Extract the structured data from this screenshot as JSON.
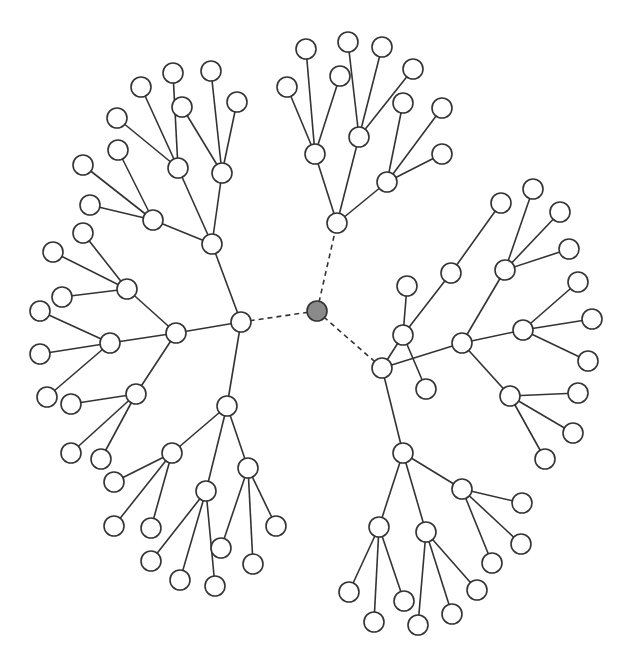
{
  "diagram": {
    "type": "radial-tree",
    "node_radius": 10,
    "colors": {
      "edge": "#333333",
      "node_fill": "#ffffff",
      "root_fill": "#8a8a8a"
    },
    "nodes": [
      {
        "id": "root",
        "x": 317,
        "y": 311,
        "root": true
      },
      {
        "id": "L",
        "x": 241,
        "y": 322
      },
      {
        "id": "LA",
        "x": 212,
        "y": 244
      },
      {
        "id": "LA1",
        "x": 153,
        "y": 220
      },
      {
        "id": "LA1a",
        "x": 83,
        "y": 165
      },
      {
        "id": "LA1b",
        "x": 90,
        "y": 205
      },
      {
        "id": "LA1c",
        "x": 118,
        "y": 150
      },
      {
        "id": "LA2",
        "x": 178,
        "y": 168
      },
      {
        "id": "LA2a",
        "x": 117,
        "y": 118
      },
      {
        "id": "LA2b",
        "x": 141,
        "y": 87
      },
      {
        "id": "LA2c",
        "x": 173,
        "y": 73
      },
      {
        "id": "LA3",
        "x": 222,
        "y": 173
      },
      {
        "id": "LA3a",
        "x": 182,
        "y": 107
      },
      {
        "id": "LA3b",
        "x": 211,
        "y": 71
      },
      {
        "id": "LA3c",
        "x": 237,
        "y": 102
      },
      {
        "id": "LB",
        "x": 176,
        "y": 333
      },
      {
        "id": "LB1",
        "x": 127,
        "y": 289
      },
      {
        "id": "LB1a",
        "x": 83,
        "y": 233
      },
      {
        "id": "LB1b",
        "x": 53,
        "y": 252
      },
      {
        "id": "LB1c",
        "x": 62,
        "y": 297
      },
      {
        "id": "LB2",
        "x": 110,
        "y": 343
      },
      {
        "id": "LB2a",
        "x": 40,
        "y": 311
      },
      {
        "id": "LB2b",
        "x": 40,
        "y": 354
      },
      {
        "id": "LB2c",
        "x": 47,
        "y": 397
      },
      {
        "id": "LB3",
        "x": 136,
        "y": 394
      },
      {
        "id": "LB3a",
        "x": 71,
        "y": 404
      },
      {
        "id": "LB3b",
        "x": 71,
        "y": 453
      },
      {
        "id": "LB3c",
        "x": 101,
        "y": 459
      },
      {
        "id": "LC",
        "x": 227,
        "y": 406
      },
      {
        "id": "LC1",
        "x": 172,
        "y": 453
      },
      {
        "id": "LC1a",
        "x": 114,
        "y": 482
      },
      {
        "id": "LC1b",
        "x": 114,
        "y": 526
      },
      {
        "id": "LC1c",
        "x": 151,
        "y": 528
      },
      {
        "id": "LC2",
        "x": 206,
        "y": 491
      },
      {
        "id": "LC2a",
        "x": 151,
        "y": 561
      },
      {
        "id": "LC2b",
        "x": 180,
        "y": 580
      },
      {
        "id": "LC2c",
        "x": 215,
        "y": 586
      },
      {
        "id": "LC3",
        "x": 248,
        "y": 468
      },
      {
        "id": "LC3a",
        "x": 221,
        "y": 548
      },
      {
        "id": "LC3b",
        "x": 253,
        "y": 564
      },
      {
        "id": "LC3c",
        "x": 276,
        "y": 526
      },
      {
        "id": "T",
        "x": 337,
        "y": 223
      },
      {
        "id": "T1",
        "x": 315,
        "y": 154
      },
      {
        "id": "T1a",
        "x": 287,
        "y": 87
      },
      {
        "id": "T1b",
        "x": 306,
        "y": 49
      },
      {
        "id": "T1c",
        "x": 340,
        "y": 76
      },
      {
        "id": "T2",
        "x": 359,
        "y": 137
      },
      {
        "id": "T2a",
        "x": 348,
        "y": 42
      },
      {
        "id": "T2b",
        "x": 382,
        "y": 47
      },
      {
        "id": "T2c",
        "x": 413,
        "y": 69
      },
      {
        "id": "T3",
        "x": 387,
        "y": 182
      },
      {
        "id": "T3a",
        "x": 403,
        "y": 103
      },
      {
        "id": "T3b",
        "x": 442,
        "y": 108
      },
      {
        "id": "T3c",
        "x": 442,
        "y": 154
      },
      {
        "id": "R",
        "x": 382,
        "y": 368
      },
      {
        "id": "R1",
        "x": 403,
        "y": 335
      },
      {
        "id": "R1a",
        "x": 407,
        "y": 286
      },
      {
        "id": "R1b",
        "x": 426,
        "y": 389
      },
      {
        "id": "R1c",
        "x": 451,
        "y": 273
      },
      {
        "id": "R1c1",
        "x": 501,
        "y": 203
      },
      {
        "id": "R2",
        "x": 462,
        "y": 343
      },
      {
        "id": "R2a",
        "x": 505,
        "y": 270
      },
      {
        "id": "R2a1",
        "x": 533,
        "y": 189
      },
      {
        "id": "R2a2",
        "x": 560,
        "y": 212
      },
      {
        "id": "R2a3",
        "x": 569,
        "y": 249
      },
      {
        "id": "R2b",
        "x": 523,
        "y": 330
      },
      {
        "id": "R2b1",
        "x": 578,
        "y": 282
      },
      {
        "id": "R2b2",
        "x": 592,
        "y": 319
      },
      {
        "id": "R2b3",
        "x": 588,
        "y": 361
      },
      {
        "id": "R2c",
        "x": 510,
        "y": 396
      },
      {
        "id": "R2c1",
        "x": 578,
        "y": 393
      },
      {
        "id": "R2c2",
        "x": 573,
        "y": 433
      },
      {
        "id": "R2c3",
        "x": 545,
        "y": 459
      },
      {
        "id": "R3",
        "x": 403,
        "y": 453
      },
      {
        "id": "R3a",
        "x": 379,
        "y": 527
      },
      {
        "id": "R3a1",
        "x": 349,
        "y": 592
      },
      {
        "id": "R3a2",
        "x": 374,
        "y": 622
      },
      {
        "id": "R3a3",
        "x": 404,
        "y": 601
      },
      {
        "id": "R3b",
        "x": 426,
        "y": 532
      },
      {
        "id": "R3b1",
        "x": 418,
        "y": 625
      },
      {
        "id": "R3b2",
        "x": 452,
        "y": 614
      },
      {
        "id": "R3b3",
        "x": 477,
        "y": 590
      },
      {
        "id": "R3c",
        "x": 462,
        "y": 489
      },
      {
        "id": "R3c1",
        "x": 522,
        "y": 503
      },
      {
        "id": "R3c2",
        "x": 521,
        "y": 544
      },
      {
        "id": "R3c3",
        "x": 492,
        "y": 563
      }
    ],
    "edges": [
      [
        "root",
        "L",
        true
      ],
      [
        "root",
        "T",
        true
      ],
      [
        "root",
        "R",
        true
      ],
      [
        "L",
        "LA"
      ],
      [
        "L",
        "LB"
      ],
      [
        "L",
        "LC"
      ],
      [
        "LA",
        "LA1"
      ],
      [
        "LA",
        "LA2"
      ],
      [
        "LA",
        "LA3"
      ],
      [
        "LA1",
        "LA1a"
      ],
      [
        "LA1",
        "LA1b"
      ],
      [
        "LA1",
        "LA1c"
      ],
      [
        "LA2",
        "LA2a"
      ],
      [
        "LA2",
        "LA2b"
      ],
      [
        "LA2",
        "LA2c"
      ],
      [
        "LA3",
        "LA3a"
      ],
      [
        "LA3",
        "LA3b"
      ],
      [
        "LA3",
        "LA3c"
      ],
      [
        "LB",
        "LB1"
      ],
      [
        "LB",
        "LB2"
      ],
      [
        "LB",
        "LB3"
      ],
      [
        "LB1",
        "LB1a"
      ],
      [
        "LB1",
        "LB1b"
      ],
      [
        "LB1",
        "LB1c"
      ],
      [
        "LB2",
        "LB2a"
      ],
      [
        "LB2",
        "LB2b"
      ],
      [
        "LB2",
        "LB2c"
      ],
      [
        "LB3",
        "LB3a"
      ],
      [
        "LB3",
        "LB3b"
      ],
      [
        "LB3",
        "LB3c"
      ],
      [
        "LC",
        "LC1"
      ],
      [
        "LC",
        "LC2"
      ],
      [
        "LC",
        "LC3"
      ],
      [
        "LC1",
        "LC1a"
      ],
      [
        "LC1",
        "LC1b"
      ],
      [
        "LC1",
        "LC1c"
      ],
      [
        "LC2",
        "LC2a"
      ],
      [
        "LC2",
        "LC2b"
      ],
      [
        "LC2",
        "LC2c"
      ],
      [
        "LC3",
        "LC3a"
      ],
      [
        "LC3",
        "LC3b"
      ],
      [
        "LC3",
        "LC3c"
      ],
      [
        "T",
        "T1"
      ],
      [
        "T",
        "T2"
      ],
      [
        "T",
        "T3"
      ],
      [
        "T1",
        "T1a"
      ],
      [
        "T1",
        "T1b"
      ],
      [
        "T1",
        "T1c"
      ],
      [
        "T2",
        "T2a"
      ],
      [
        "T2",
        "T2b"
      ],
      [
        "T2",
        "T2c"
      ],
      [
        "T3",
        "T3a"
      ],
      [
        "T3",
        "T3b"
      ],
      [
        "T3",
        "T3c"
      ],
      [
        "R",
        "R1"
      ],
      [
        "R",
        "R2"
      ],
      [
        "R",
        "R3"
      ],
      [
        "R1",
        "R1a"
      ],
      [
        "R1",
        "R1b"
      ],
      [
        "R1",
        "R1c"
      ],
      [
        "R1c",
        "R1c1"
      ],
      [
        "R2",
        "R2a"
      ],
      [
        "R2",
        "R2b"
      ],
      [
        "R2",
        "R2c"
      ],
      [
        "R2a",
        "R2a1"
      ],
      [
        "R2a",
        "R2a2"
      ],
      [
        "R2a",
        "R2a3"
      ],
      [
        "R2b",
        "R2b1"
      ],
      [
        "R2b",
        "R2b2"
      ],
      [
        "R2b",
        "R2b3"
      ],
      [
        "R2c",
        "R2c1"
      ],
      [
        "R2c",
        "R2c2"
      ],
      [
        "R2c",
        "R2c3"
      ],
      [
        "R3",
        "R3a"
      ],
      [
        "R3",
        "R3b"
      ],
      [
        "R3",
        "R3c"
      ],
      [
        "R3a",
        "R3a1"
      ],
      [
        "R3a",
        "R3a2"
      ],
      [
        "R3a",
        "R3a3"
      ],
      [
        "R3b",
        "R3b1"
      ],
      [
        "R3b",
        "R3b2"
      ],
      [
        "R3b",
        "R3b3"
      ],
      [
        "R3c",
        "R3c1"
      ],
      [
        "R3c",
        "R3c2"
      ],
      [
        "R3c",
        "R3c3"
      ]
    ]
  }
}
